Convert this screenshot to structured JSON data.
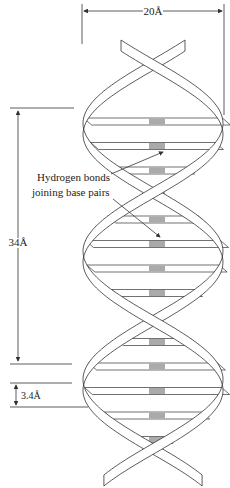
{
  "diagram": {
    "labels": {
      "width_dimension": "20Å",
      "pitch_dimension": "34Å",
      "base_spacing_dimension": "3.4Å",
      "annotation_line1": "Hydrogen bonds",
      "annotation_line2": "joining base pairs"
    },
    "colors": {
      "line": "#333333",
      "strand_fill": "#ffffff",
      "bond_fill": "#aaaaaa"
    }
  }
}
